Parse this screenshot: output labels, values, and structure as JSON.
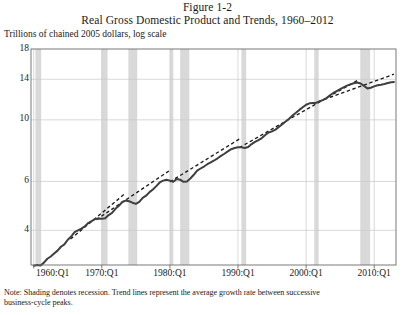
{
  "figure": {
    "title_line1": "Figure 1-2",
    "title_line2": "Real Gross Domestic Product and Trends, 1960–2012",
    "subtitle": "Trillions of chained 2005 dollars, log scale",
    "note_line1": "Note: Shading denotes recession. Trend lines represent the average growth rate between successive",
    "note_line2": "business-cycle peaks."
  },
  "colors": {
    "series_line": "#3f3f3f",
    "trend_line": "#1c1c1c",
    "recession_band": "#d9d9d9",
    "gridline": "#c9c9c9",
    "axis": "#6b6b6b",
    "text": "#1a1a1a",
    "background": "#ffffff"
  },
  "chart_data": {
    "type": "line",
    "title": "Real Gross Domestic Product and Trends, 1960–2012",
    "subtitle": "Trillions of chained 2005 dollars, log scale",
    "xlabel": "",
    "ylabel": "Trillions of chained 2005 dollars, log scale",
    "yscale": "log",
    "ylim": [
      3.0,
      18.0
    ],
    "xlim": [
      "1960:Q1",
      "2012:Q4"
    ],
    "grid": true,
    "legend": "none",
    "ytick_labels": [
      "18",
      "14",
      "10",
      "6",
      "4"
    ],
    "ytick_values": [
      18,
      14,
      10,
      6,
      4
    ],
    "xtick_labels": [
      "1960:Q1",
      "1970:Q1",
      "1980:Q1",
      "1990:Q1",
      "2000:Q1",
      "2010:Q1"
    ],
    "xtick_values": [
      1960.0,
      1970.0,
      1980.0,
      1990.0,
      2000.0,
      2010.0
    ],
    "series": [
      {
        "name": "Real Gross Domestic Product",
        "style": "solid",
        "x": [
          1960.0,
          1960.5,
          1961.0,
          1961.5,
          1962.0,
          1962.5,
          1963.0,
          1963.5,
          1964.0,
          1964.5,
          1965.0,
          1965.5,
          1966.0,
          1966.5,
          1967.0,
          1967.5,
          1968.0,
          1968.5,
          1969.0,
          1969.5,
          1970.0,
          1970.5,
          1971.0,
          1971.5,
          1972.0,
          1972.5,
          1973.0,
          1973.5,
          1974.0,
          1974.5,
          1975.0,
          1975.5,
          1976.0,
          1976.5,
          1977.0,
          1977.5,
          1978.0,
          1978.5,
          1979.0,
          1979.5,
          1980.0,
          1980.5,
          1981.0,
          1981.5,
          1982.0,
          1982.5,
          1983.0,
          1983.5,
          1984.0,
          1984.5,
          1985.0,
          1985.5,
          1986.0,
          1986.5,
          1987.0,
          1987.5,
          1988.0,
          1988.5,
          1989.0,
          1989.5,
          1990.0,
          1990.5,
          1991.0,
          1991.5,
          1992.0,
          1992.5,
          1993.0,
          1993.5,
          1994.0,
          1994.5,
          1995.0,
          1995.5,
          1996.0,
          1996.5,
          1997.0,
          1997.5,
          1998.0,
          1998.5,
          1999.0,
          1999.5,
          2000.0,
          2000.5,
          2001.0,
          2001.5,
          2002.0,
          2002.5,
          2003.0,
          2003.5,
          2004.0,
          2004.5,
          2005.0,
          2005.5,
          2006.0,
          2006.5,
          2007.0,
          2007.5,
          2008.0,
          2008.5,
          2009.0,
          2009.5,
          2010.0,
          2010.5,
          2011.0,
          2011.5,
          2012.0,
          2012.5,
          2012.9
        ],
        "y": [
          2.98,
          3.0,
          2.99,
          3.06,
          3.16,
          3.22,
          3.3,
          3.38,
          3.49,
          3.56,
          3.7,
          3.8,
          3.94,
          4.0,
          4.06,
          4.13,
          4.25,
          4.32,
          4.39,
          4.41,
          4.4,
          4.42,
          4.54,
          4.62,
          4.78,
          4.9,
          5.06,
          5.12,
          5.09,
          5.03,
          4.98,
          5.06,
          5.24,
          5.33,
          5.49,
          5.61,
          5.77,
          5.95,
          6.04,
          6.08,
          6.04,
          5.98,
          6.12,
          6.09,
          5.98,
          6.0,
          6.15,
          6.34,
          6.56,
          6.68,
          6.79,
          6.92,
          7.03,
          7.14,
          7.27,
          7.42,
          7.55,
          7.7,
          7.84,
          7.92,
          7.97,
          7.96,
          7.92,
          7.98,
          8.18,
          8.33,
          8.46,
          8.6,
          8.82,
          9.0,
          9.09,
          9.22,
          9.43,
          9.65,
          9.87,
          10.1,
          10.36,
          10.6,
          10.86,
          11.1,
          11.34,
          11.47,
          11.51,
          11.53,
          11.66,
          11.8,
          11.98,
          12.26,
          12.5,
          12.7,
          12.9,
          13.09,
          13.28,
          13.42,
          13.55,
          13.64,
          13.52,
          13.25,
          12.98,
          13.05,
          13.2,
          13.32,
          13.38,
          13.47,
          13.58,
          13.65,
          13.7
        ],
        "start_value": 2.98,
        "end_value": 13.7,
        "units": "trillions of chained 2005 dollars"
      }
    ],
    "trend_lines": [
      {
        "name": "trend-1960-1969",
        "style": "dashed",
        "x0": 1965.4,
        "y0": 3.72,
        "x1": 1973.5,
        "y1": 5.45
      },
      {
        "name": "trend-1969-1973",
        "style": "dashed",
        "x0": 1969.2,
        "y0": 4.37,
        "x1": 1980.0,
        "y1": 6.58
      },
      {
        "name": "trend-1979-1990",
        "style": "dashed",
        "x0": 1980.0,
        "y0": 5.98,
        "x1": 1990.5,
        "y1": 8.62
      },
      {
        "name": "trend-1990-2007",
        "style": "dashed",
        "x0": 1990.2,
        "y0": 7.94,
        "x1": 2007.6,
        "y1": 13.9
      },
      {
        "name": "trend-2001-2012",
        "style": "dashed",
        "x0": 2001.0,
        "y0": 11.45,
        "x1": 2012.9,
        "y1": 14.6
      }
    ],
    "recession_bands": [
      {
        "label": "1960-61",
        "start": 1960.25,
        "end": 1961.1
      },
      {
        "label": "1970",
        "start": 1969.95,
        "end": 1970.85
      },
      {
        "label": "1973-75",
        "start": 1973.9,
        "end": 1975.2
      },
      {
        "label": "1980",
        "start": 1980.0,
        "end": 1980.5
      },
      {
        "label": "1981-82",
        "start": 1981.5,
        "end": 1982.85
      },
      {
        "label": "1990-91",
        "start": 1990.5,
        "end": 1991.2
      },
      {
        "label": "2001",
        "start": 2001.2,
        "end": 2001.85
      },
      {
        "label": "2007-09",
        "start": 2007.95,
        "end": 2009.4
      }
    ]
  }
}
